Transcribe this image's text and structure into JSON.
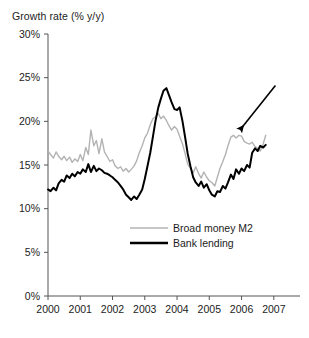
{
  "chart_data": {
    "type": "line",
    "title": "Growth rate (% y/y)",
    "xlabel": "",
    "ylabel": "Growth rate (% y/y)",
    "ylim": [
      0,
      30
    ],
    "xlim": [
      2000,
      2007.75
    ],
    "y_ticks": [
      "0%",
      "5%",
      "10%",
      "15%",
      "20%",
      "25%",
      "30%"
    ],
    "y_tick_values": [
      0,
      5,
      10,
      15,
      20,
      25,
      30
    ],
    "x_ticks": [
      "2000",
      "2001",
      "2002",
      "2003",
      "2004",
      "2005",
      "2006",
      "2007"
    ],
    "x_tick_values": [
      2000,
      2001,
      2002,
      2003,
      2004,
      2005,
      2006,
      2007
    ],
    "grid": false,
    "legend_position": "center-lower",
    "annotations": [
      {
        "name": "arrow-annotation",
        "type": "arrow",
        "from_x": 2007.05,
        "from_y": 24.1,
        "to_x": 2005.95,
        "to_y": 19.0,
        "text": ""
      }
    ],
    "series": [
      {
        "name": "Broad money M2",
        "color": "#b3b3b3",
        "width": 1.4,
        "x": [
          2000.0,
          2000.08,
          2000.17,
          2000.25,
          2000.33,
          2000.42,
          2000.5,
          2000.58,
          2000.67,
          2000.75,
          2000.83,
          2000.92,
          2001.0,
          2001.08,
          2001.17,
          2001.25,
          2001.33,
          2001.42,
          2001.5,
          2001.58,
          2001.67,
          2001.75,
          2001.83,
          2001.92,
          2002.0,
          2002.08,
          2002.17,
          2002.25,
          2002.33,
          2002.42,
          2002.5,
          2002.58,
          2002.67,
          2002.75,
          2002.83,
          2002.92,
          2003.0,
          2003.08,
          2003.17,
          2003.25,
          2003.33,
          2003.42,
          2003.5,
          2003.58,
          2003.67,
          2003.75,
          2003.83,
          2003.92,
          2004.0,
          2004.08,
          2004.17,
          2004.25,
          2004.33,
          2004.42,
          2004.5,
          2004.58,
          2004.67,
          2004.75,
          2004.83,
          2004.92,
          2005.0,
          2005.08,
          2005.17,
          2005.25,
          2005.33,
          2005.42,
          2005.5,
          2005.58,
          2005.67,
          2005.75,
          2005.83,
          2005.92,
          2006.0,
          2006.08,
          2006.17,
          2006.25,
          2006.33,
          2006.42,
          2006.5,
          2006.58,
          2006.67,
          2006.75
        ],
        "values": [
          16.6,
          16.2,
          15.8,
          16.5,
          16.0,
          15.6,
          16.0,
          15.5,
          15.9,
          15.3,
          15.7,
          15.4,
          16.2,
          15.5,
          17.0,
          16.2,
          19.0,
          17.2,
          17.8,
          16.3,
          18.0,
          16.5,
          16.0,
          15.4,
          15.6,
          14.9,
          14.6,
          14.8,
          14.3,
          14.6,
          14.2,
          14.5,
          14.9,
          15.5,
          16.4,
          17.2,
          18.1,
          18.6,
          19.6,
          20.3,
          20.5,
          20.9,
          20.3,
          20.6,
          20.1,
          19.5,
          19.0,
          19.4,
          19.1,
          18.3,
          17.4,
          16.3,
          15.1,
          14.6,
          14.1,
          14.8,
          14.0,
          13.5,
          14.2,
          13.6,
          13.2,
          13.0,
          12.6,
          13.6,
          14.6,
          15.4,
          16.2,
          17.2,
          18.2,
          18.4,
          18.1,
          18.4,
          18.3,
          17.7,
          17.5,
          17.4,
          17.6,
          17.1,
          16.9,
          16.6,
          17.4,
          18.4
        ]
      },
      {
        "name": "Bank lending",
        "color": "#000000",
        "width": 2.0,
        "x": [
          2000.0,
          2000.08,
          2000.17,
          2000.25,
          2000.33,
          2000.42,
          2000.5,
          2000.58,
          2000.67,
          2000.75,
          2000.83,
          2000.92,
          2001.0,
          2001.08,
          2001.17,
          2001.25,
          2001.33,
          2001.42,
          2001.5,
          2001.58,
          2001.67,
          2001.75,
          2001.83,
          2001.92,
          2002.0,
          2002.08,
          2002.17,
          2002.25,
          2002.33,
          2002.42,
          2002.5,
          2002.58,
          2002.67,
          2002.75,
          2002.83,
          2002.92,
          2003.0,
          2003.08,
          2003.17,
          2003.25,
          2003.33,
          2003.42,
          2003.5,
          2003.58,
          2003.67,
          2003.75,
          2003.83,
          2003.92,
          2004.0,
          2004.08,
          2004.17,
          2004.25,
          2004.33,
          2004.42,
          2004.5,
          2004.58,
          2004.67,
          2004.75,
          2004.83,
          2004.92,
          2005.0,
          2005.08,
          2005.17,
          2005.25,
          2005.33,
          2005.42,
          2005.5,
          2005.58,
          2005.67,
          2005.75,
          2005.83,
          2005.92,
          2006.0,
          2006.08,
          2006.17,
          2006.25,
          2006.33,
          2006.42,
          2006.5,
          2006.58,
          2006.67,
          2006.75
        ],
        "values": [
          12.2,
          12.0,
          12.4,
          12.1,
          12.9,
          13.3,
          13.1,
          13.8,
          13.5,
          14.0,
          13.7,
          14.2,
          14.0,
          14.5,
          14.2,
          15.1,
          14.2,
          14.9,
          14.3,
          14.6,
          14.4,
          14.1,
          14.0,
          13.8,
          13.6,
          13.3,
          13.0,
          12.6,
          12.2,
          11.6,
          11.3,
          11.0,
          11.4,
          11.1,
          11.6,
          12.2,
          13.4,
          14.8,
          16.4,
          18.2,
          20.0,
          21.6,
          22.6,
          23.5,
          23.8,
          23.0,
          22.2,
          21.4,
          21.3,
          21.6,
          20.0,
          18.2,
          16.3,
          14.8,
          13.6,
          13.0,
          12.6,
          13.1,
          12.4,
          12.8,
          12.1,
          11.6,
          11.4,
          12.0,
          11.9,
          12.6,
          12.3,
          13.0,
          13.9,
          13.4,
          14.5,
          14.0,
          14.6,
          14.3,
          15.0,
          14.7,
          16.4,
          16.9,
          16.6,
          17.2,
          17.0,
          17.3
        ]
      }
    ]
  },
  "legend": {
    "items": [
      {
        "label": "Broad money M2",
        "color": "#b3b3b3"
      },
      {
        "label": "Bank lending",
        "color": "#000000"
      }
    ]
  }
}
